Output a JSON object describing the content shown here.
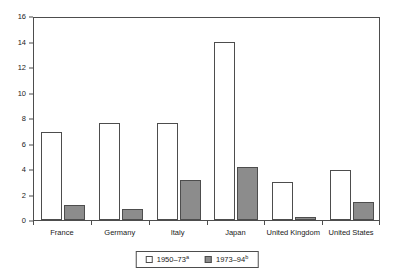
{
  "chart_data": {
    "type": "bar",
    "title": "",
    "subtitle": "",
    "xlabel": "",
    "ylabel": "",
    "ylim": [
      0,
      16
    ],
    "ytick_step": 2,
    "yticks": [
      0,
      2,
      4,
      6,
      8,
      10,
      12,
      14,
      16
    ],
    "ytick_labels": [
      "0",
      "2",
      "4",
      "6",
      "8",
      "10",
      "12",
      "14",
      "16"
    ],
    "grid": false,
    "legend_position": "bottom-center",
    "categories": [
      "France",
      "Germany",
      "Italy",
      "Japan",
      "United Kingdom",
      "United States"
    ],
    "series": [
      {
        "name": "1950–73",
        "footnote_marker": "a",
        "color": "#ffffff",
        "edge_color": "#4d4d4d",
        "values": [
          6.9,
          7.6,
          7.6,
          14.0,
          3.0,
          3.95
        ]
      },
      {
        "name": "1973–94",
        "footnote_marker": "b",
        "color": "#8c8c8c",
        "edge_color": "#4d4d4d",
        "values": [
          1.2,
          0.9,
          3.1,
          4.15,
          0.2,
          1.45
        ]
      }
    ]
  },
  "legend": {
    "entries": [
      {
        "label": "1950–73",
        "marker": "a",
        "swatch": "white-square-swatch"
      },
      {
        "label": "1973–94",
        "marker": "b",
        "swatch": "gray-square-swatch"
      }
    ]
  },
  "colors": {
    "series_1950_73": "#ffffff",
    "series_1973_94": "#8c8c8c",
    "axis": "#4d4d4d",
    "text": "#1a1a1a",
    "background": "#ffffff"
  }
}
